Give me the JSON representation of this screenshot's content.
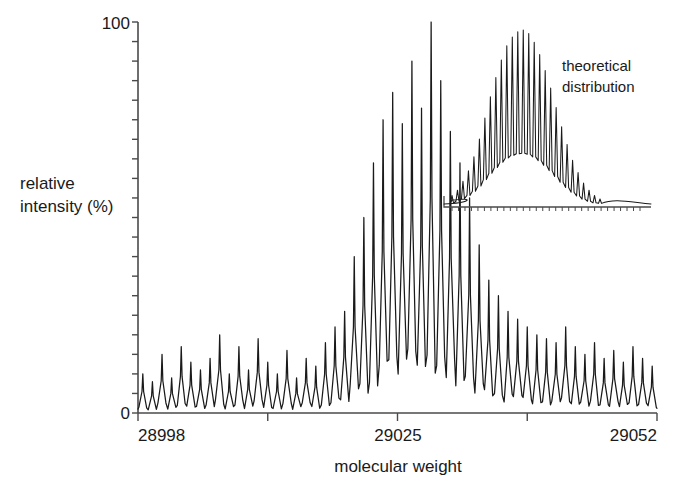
{
  "figure": {
    "name": "mass-spectrum-figure",
    "axis_color": "#4a4a4a",
    "trace_color": "#1a1a1a"
  },
  "axes": {
    "y_label_line1": "relative",
    "y_label_line2": "intensity (%)",
    "y_ticks": [
      "0",
      "100"
    ],
    "y_min_label": "0",
    "y_max_label": "100",
    "x_label": "molecular weight",
    "x_min_label": "28998",
    "x_mid_label": "29025",
    "x_max_label": "29052"
  },
  "inset": {
    "label_line1": "theoretical",
    "label_line2": "distribution"
  },
  "chart_data": {
    "type": "line",
    "title": "",
    "xlabel": "molecular weight",
    "ylabel": "relative intensity (%)",
    "xlim": [
      28998,
      29052
    ],
    "ylim": [
      0,
      100
    ],
    "grid": false,
    "legend": "none",
    "x_ticks": [
      28998,
      29011.5,
      29025,
      29038.5,
      29052
    ],
    "x_tick_labels": [
      "28998",
      "",
      "29025",
      "",
      "29052"
    ],
    "y_ticks": [
      0,
      5,
      10,
      15,
      20,
      25,
      30,
      35,
      40,
      45,
      50,
      55,
      60,
      65,
      70,
      75,
      80,
      85,
      90,
      95,
      100
    ],
    "y_tick_labels": [
      "0",
      "",
      "",
      "",
      "",
      "",
      "",
      "",
      "",
      "",
      "",
      "",
      "",
      "",
      "",
      "",
      "",
      "",
      "",
      "",
      "100"
    ],
    "series": [
      {
        "name": "measured spectrum",
        "peak_spacing_da": 1,
        "peaks_x": [
          28998.5,
          28999.5,
          29000.5,
          29001.5,
          29002.5,
          29003.5,
          29004.5,
          29005.5,
          29006.5,
          29007.5,
          29008.5,
          29009.5,
          29010.5,
          29011.5,
          29012.5,
          29013.5,
          29014.5,
          29015.5,
          29016.5,
          29017.5,
          29018.5,
          29019.5,
          29020.5,
          29021.5,
          29022.5,
          29023.5,
          29024.5,
          29025.5,
          29026.5,
          29027.5,
          29028.5,
          29029.5,
          29030.5,
          29031.5,
          29032.5,
          29033.5,
          29034.5,
          29035.5,
          29036.5,
          29037.5,
          29038.5,
          29039.5,
          29040.5,
          29041.5,
          29042.5,
          29043.5,
          29044.5,
          29045.5,
          29046.5,
          29047.5,
          29048.5,
          29049.5,
          29050.5,
          29051.5
        ],
        "peaks_y": [
          10,
          8,
          15,
          9,
          17,
          13,
          11,
          14,
          20,
          10,
          17,
          11,
          19,
          13,
          10,
          16,
          9,
          14,
          12,
          18,
          22,
          26,
          40,
          50,
          64,
          75,
          82,
          74,
          90,
          78,
          100,
          85,
          72,
          64,
          55,
          43,
          34,
          30,
          26,
          24,
          22,
          20,
          19,
          18,
          22,
          17,
          15,
          18,
          14,
          16,
          13,
          17,
          14,
          12
        ]
      },
      {
        "name": "theoretical distribution (inset)",
        "peaks_y": [
          6,
          9,
          14,
          20,
          28,
          38,
          50,
          62,
          73,
          83,
          91,
          96,
          99,
          100,
          98,
          93,
          86,
          77,
          67,
          56,
          45,
          35,
          26,
          19,
          13,
          9,
          6,
          4
        ]
      }
    ]
  }
}
